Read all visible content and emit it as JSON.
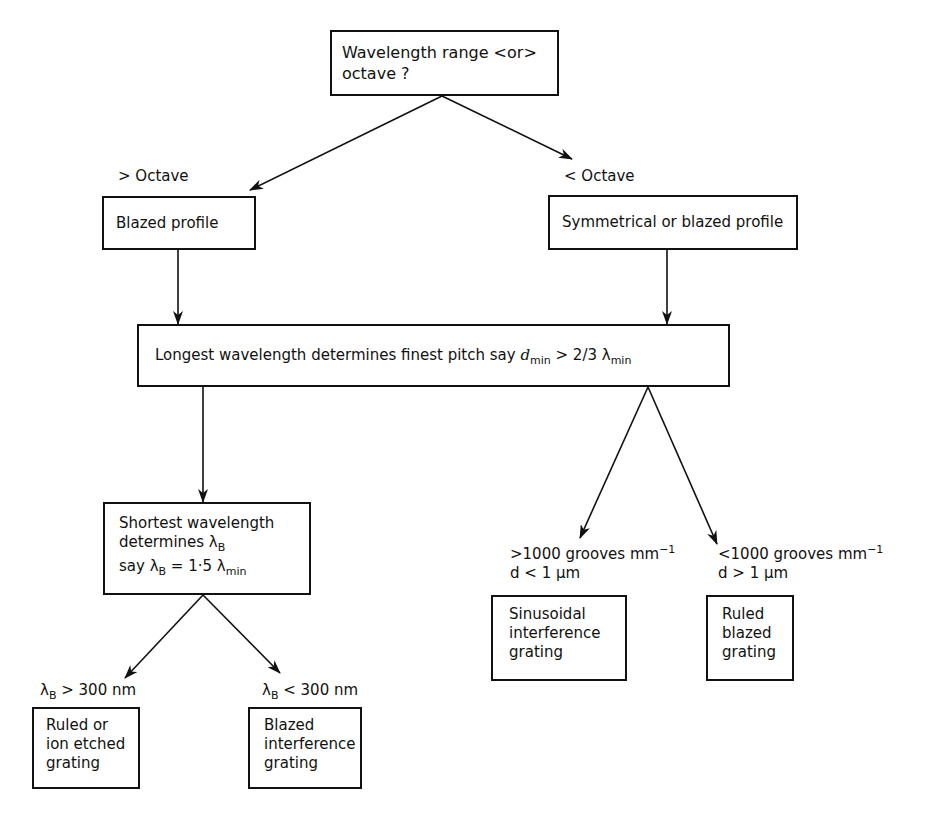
{
  "diagram": {
    "type": "flowchart",
    "nodes": {
      "root": {
        "line1": "Wavelength range <or>",
        "line2": "octave ?"
      },
      "blazed_profile": {
        "text": "Blazed profile"
      },
      "symmetrical_profile": {
        "text": "Symmetrical or blazed profile"
      },
      "longest_wavelength": {
        "text": "Longest wavelength determines finest pitch say ",
        "var": "d",
        "var_sub": "min",
        "relation": " > 2/3 λ",
        "rel_sub": "min"
      },
      "shortest_wavelength": {
        "line1": "Shortest wavelength",
        "line2_pre": "determines λ",
        "line2_sub": "B",
        "line3_pre": "say λ",
        "line3_sub": "B",
        "line3_mid": " = 1·5 λ",
        "line3_sub2": "min"
      },
      "sinusoidal": {
        "line1": "Sinusoidal",
        "line2": "interference",
        "line3": "grating"
      },
      "ruled_blazed": {
        "line1": "Ruled",
        "line2": "blazed",
        "line3": "grating"
      },
      "ruled_ion": {
        "line1": "Ruled or",
        "line2": "ion etched",
        "line3": "grating"
      },
      "blazed_interference": {
        "line1": "Blazed",
        "line2": "interference",
        "line3": "grating"
      }
    },
    "edge_labels": {
      "gt_octave": "> Octave",
      "lt_octave": "< Octave",
      "gt_1000_line1": ">1000 grooves mm",
      "gt_1000_sup": "−1",
      "gt_1000_line2": "d < 1 μm",
      "lt_1000_line1": "<1000 grooves mm",
      "lt_1000_sup": "−1",
      "lt_1000_line2": "d > 1 μm",
      "lambda_gt_pre": "λ",
      "lambda_gt_sub": "B",
      "lambda_gt_post": " > 300 nm",
      "lambda_lt_pre": "λ",
      "lambda_lt_sub": "B",
      "lambda_lt_post": " < 300 nm"
    },
    "colors": {
      "line": "#111111",
      "background": "#ffffff"
    }
  }
}
